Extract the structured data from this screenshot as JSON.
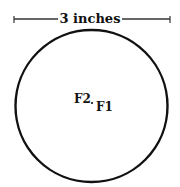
{
  "diagram": {
    "dimension_label": "3 inches",
    "points": [
      {
        "label": "F2"
      },
      {
        "label": "F1"
      }
    ],
    "colors": {
      "stroke": "#111111",
      "background": "#ffffff"
    }
  }
}
